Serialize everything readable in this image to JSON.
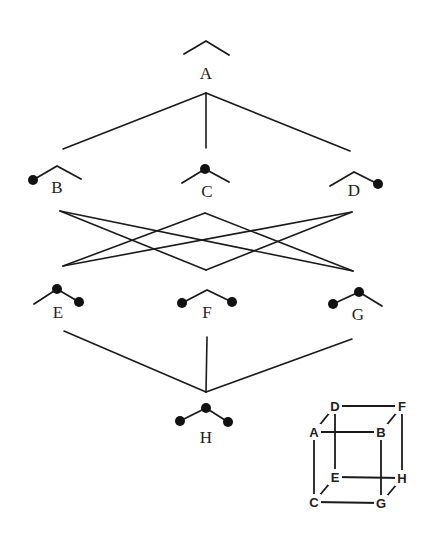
{
  "figure": {
    "type": "lattice-diagram"
  },
  "colors": {
    "ink": "#1a1a1a",
    "background": "#ffffff"
  },
  "nodes": [
    {
      "id": "A",
      "label": "A",
      "label_pos": [
        206,
        79
      ],
      "glyph": {
        "points": [
          [
            184,
            54
          ],
          [
            206,
            41
          ],
          [
            229,
            55
          ]
        ],
        "dots": []
      }
    },
    {
      "id": "B",
      "label": "B",
      "label_pos": [
        57,
        193
      ],
      "glyph": {
        "points": [
          [
            33,
            180
          ],
          [
            57,
            166
          ],
          [
            81,
            179
          ]
        ],
        "dots": [
          0
        ]
      }
    },
    {
      "id": "C",
      "label": "C",
      "label_pos": [
        207,
        197
      ],
      "glyph": {
        "points": [
          [
            182,
            183
          ],
          [
            205,
            169
          ],
          [
            229,
            182
          ]
        ],
        "dots": [
          1
        ]
      }
    },
    {
      "id": "D",
      "label": "D",
      "label_pos": [
        354,
        196
      ],
      "glyph": {
        "points": [
          [
            330,
            186
          ],
          [
            354,
            172
          ],
          [
            378,
            184
          ]
        ],
        "dots": [
          2
        ]
      }
    },
    {
      "id": "E",
      "label": "E",
      "label_pos": [
        58,
        318
      ],
      "glyph": {
        "points": [
          [
            34,
            304
          ],
          [
            57,
            289
          ],
          [
            79,
            302
          ]
        ],
        "dots": [
          1,
          2
        ]
      }
    },
    {
      "id": "F",
      "label": "F",
      "label_pos": [
        207,
        318
      ],
      "glyph": {
        "points": [
          [
            182,
            303
          ],
          [
            207,
            290
          ],
          [
            232,
            302
          ]
        ],
        "dots": [
          0,
          2
        ]
      }
    },
    {
      "id": "G",
      "label": "G",
      "label_pos": [
        358,
        320
      ],
      "glyph": {
        "points": [
          [
            333,
            304
          ],
          [
            359,
            292
          ],
          [
            382,
            306
          ]
        ],
        "dots": [
          0,
          1
        ]
      }
    },
    {
      "id": "H",
      "label": "H",
      "label_pos": [
        206,
        443
      ],
      "glyph": {
        "points": [
          [
            180,
            421
          ],
          [
            206,
            408
          ],
          [
            228,
            422
          ]
        ],
        "dots": [
          0,
          1,
          2
        ]
      }
    }
  ],
  "edges": [
    {
      "from": "A",
      "to": "B",
      "line": [
        [
          206,
          93
        ],
        [
          63,
          149
        ]
      ]
    },
    {
      "from": "A",
      "to": "C",
      "line": [
        [
          206,
          93
        ],
        [
          206,
          148
        ]
      ]
    },
    {
      "from": "A",
      "to": "D",
      "line": [
        [
          206,
          93
        ],
        [
          350,
          151
        ]
      ]
    },
    {
      "from": "B",
      "to": "F",
      "line": [
        [
          60,
          211
        ],
        [
          206,
          270
        ]
      ]
    },
    {
      "from": "B",
      "to": "G",
      "line": [
        [
          60,
          211
        ],
        [
          353,
          271
        ]
      ]
    },
    {
      "from": "C",
      "to": "E",
      "line": [
        [
          205,
          213
        ],
        [
          63,
          266
        ]
      ]
    },
    {
      "from": "C",
      "to": "G",
      "line": [
        [
          205,
          213
        ],
        [
          353,
          271
        ]
      ]
    },
    {
      "from": "D",
      "to": "E",
      "line": [
        [
          352,
          212
        ],
        [
          63,
          266
        ]
      ]
    },
    {
      "from": "D",
      "to": "F",
      "line": [
        [
          352,
          212
        ],
        [
          206,
          270
        ]
      ]
    },
    {
      "from": "E",
      "to": "H",
      "line": [
        [
          64,
          331
        ],
        [
          206,
          392
        ]
      ]
    },
    {
      "from": "F",
      "to": "H",
      "line": [
        [
          207,
          337
        ],
        [
          206,
          392
        ]
      ]
    },
    {
      "from": "G",
      "to": "H",
      "line": [
        [
          352,
          339
        ],
        [
          206,
          392
        ]
      ]
    }
  ],
  "inset_cube": {
    "vertices": {
      "A": [
        314,
        432
      ],
      "B": [
        381,
        432
      ],
      "C": [
        314,
        502
      ],
      "G": [
        381,
        503
      ],
      "D": [
        335,
        406
      ],
      "F": [
        402,
        406
      ],
      "E": [
        335,
        477
      ],
      "H": [
        402,
        478
      ]
    },
    "edges": [
      [
        "A",
        "B"
      ],
      [
        "A",
        "C"
      ],
      [
        "A",
        "D"
      ],
      [
        "B",
        "F"
      ],
      [
        "B",
        "G"
      ],
      [
        "C",
        "E"
      ],
      [
        "C",
        "G"
      ],
      [
        "D",
        "E"
      ],
      [
        "D",
        "F"
      ],
      [
        "E",
        "H"
      ],
      [
        "F",
        "H"
      ],
      [
        "G",
        "H"
      ]
    ]
  }
}
